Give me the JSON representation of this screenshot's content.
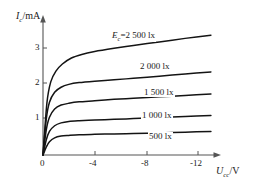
{
  "chart_data": {
    "type": "line",
    "title": "",
    "xlabel": "U_cc/V",
    "ylabel": "I_c/mA",
    "xlabel_main": "U",
    "xlabel_sub": "cc",
    "xlabel_unit": "/V",
    "ylabel_main": "I",
    "ylabel_sub": "c",
    "ylabel_unit": "/mA",
    "xlim": [
      0,
      -14
    ],
    "ylim": [
      0,
      3.6
    ],
    "x_ticks": [
      "0",
      "-4",
      "-8",
      "-12"
    ],
    "x_tick_values": [
      0,
      -4,
      -8,
      -12
    ],
    "y_ticks": [
      "1",
      "2",
      "3"
    ],
    "y_tick_values": [
      1,
      2,
      3
    ],
    "grid": false,
    "legend_position": "inline-on-curves",
    "series": [
      {
        "name": "Ec=2 500 lx",
        "label_prefix": "E",
        "label_sub": "c",
        "label_text": "=2 500 lx",
        "illuminance_lx": 2500,
        "x": [
          0,
          -0.3,
          -0.6,
          -1.0,
          -1.5,
          -2.2,
          -3.0,
          -4.0,
          -5.5,
          -7.0,
          -9.0,
          -11.0,
          -13.0
        ],
        "y": [
          0,
          1.45,
          2.05,
          2.35,
          2.55,
          2.72,
          2.82,
          2.9,
          2.99,
          3.07,
          3.17,
          3.27,
          3.36
        ]
      },
      {
        "name": "2 000 lx",
        "label_prefix": "",
        "label_sub": "",
        "label_text": "2 000 lx",
        "illuminance_lx": 2000,
        "x": [
          0,
          -0.25,
          -0.5,
          -0.9,
          -1.4,
          -2.0,
          -2.8,
          -4.0,
          -5.5,
          -7.0,
          -9.0,
          -11.0,
          -13.0
        ],
        "y": [
          0,
          1.0,
          1.48,
          1.76,
          1.9,
          1.98,
          2.03,
          2.07,
          2.11,
          2.15,
          2.21,
          2.27,
          2.33
        ]
      },
      {
        "name": "1 500 lx",
        "label_prefix": "",
        "label_sub": "",
        "label_text": "1 500 lx",
        "illuminance_lx": 1500,
        "x": [
          0,
          -0.25,
          -0.5,
          -0.9,
          -1.4,
          -2.0,
          -2.8,
          -4.0,
          -5.5,
          -7.0,
          -9.0,
          -11.0,
          -13.0
        ],
        "y": [
          0,
          0.7,
          1.06,
          1.29,
          1.4,
          1.45,
          1.49,
          1.52,
          1.56,
          1.59,
          1.63,
          1.67,
          1.71
        ]
      },
      {
        "name": "1 000 lx",
        "label_prefix": "",
        "label_sub": "",
        "label_text": "1 000 lx",
        "illuminance_lx": 1000,
        "x": [
          0,
          -0.25,
          -0.5,
          -0.9,
          -1.4,
          -2.0,
          -2.8,
          -4.0,
          -5.5,
          -7.0,
          -9.0,
          -11.0,
          -13.0
        ],
        "y": [
          0,
          0.42,
          0.66,
          0.82,
          0.9,
          0.94,
          0.96,
          0.98,
          1.0,
          1.02,
          1.05,
          1.08,
          1.11
        ]
      },
      {
        "name": "500 lx",
        "label_prefix": "",
        "label_sub": "",
        "label_text": "500 lx",
        "illuminance_lx": 500,
        "x": [
          0,
          -0.25,
          -0.5,
          -0.9,
          -1.4,
          -2.0,
          -2.8,
          -4.0,
          -5.5,
          -7.0,
          -9.0,
          -11.0,
          -13.0
        ],
        "y": [
          0,
          0.22,
          0.37,
          0.48,
          0.53,
          0.55,
          0.57,
          0.58,
          0.59,
          0.6,
          0.62,
          0.64,
          0.66
        ]
      }
    ],
    "colors": {
      "curve": "#141414",
      "axis": "#555555",
      "background": "#ffffff",
      "text": "#1a1a1a"
    }
  }
}
